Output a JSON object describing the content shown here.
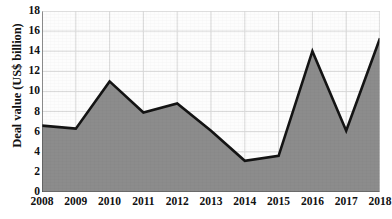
{
  "chart_data": {
    "type": "area",
    "title": "",
    "xlabel": "",
    "ylabel": "Deal value (US$ billion)",
    "categories": [
      "2008",
      "2009",
      "2010",
      "2011",
      "2012",
      "2013",
      "2014",
      "2015",
      "2016",
      "2017",
      "2018"
    ],
    "values": [
      6.6,
      6.3,
      11.0,
      7.9,
      8.8,
      6.1,
      3.1,
      3.6,
      14.0,
      6.1,
      15.3
    ],
    "series": [
      {
        "name": "Deal value",
        "values": [
          6.6,
          6.3,
          11.0,
          7.9,
          8.8,
          6.1,
          3.1,
          3.6,
          14.0,
          6.1,
          15.3
        ]
      }
    ],
    "ylim": [
      0,
      18
    ],
    "yticks": [
      0,
      2,
      4,
      6,
      8,
      10,
      12,
      14,
      16,
      18
    ],
    "ytick_labels": [
      "0",
      "2",
      "4",
      "6",
      "8",
      "10",
      "12",
      "14",
      "16",
      "18"
    ],
    "xtick_labels": [
      "2008",
      "2009",
      "2010",
      "2011",
      "2012",
      "2013",
      "2014",
      "2015",
      "2016",
      "2017",
      "2018"
    ],
    "grid": true,
    "legend": "none",
    "colors": {
      "area_fill": "#8c8c8c",
      "line": "#141414",
      "grid": "#d9d9d9",
      "axis": "#4d4d4d",
      "background": "#fdfdfd",
      "text": "#111111"
    }
  }
}
